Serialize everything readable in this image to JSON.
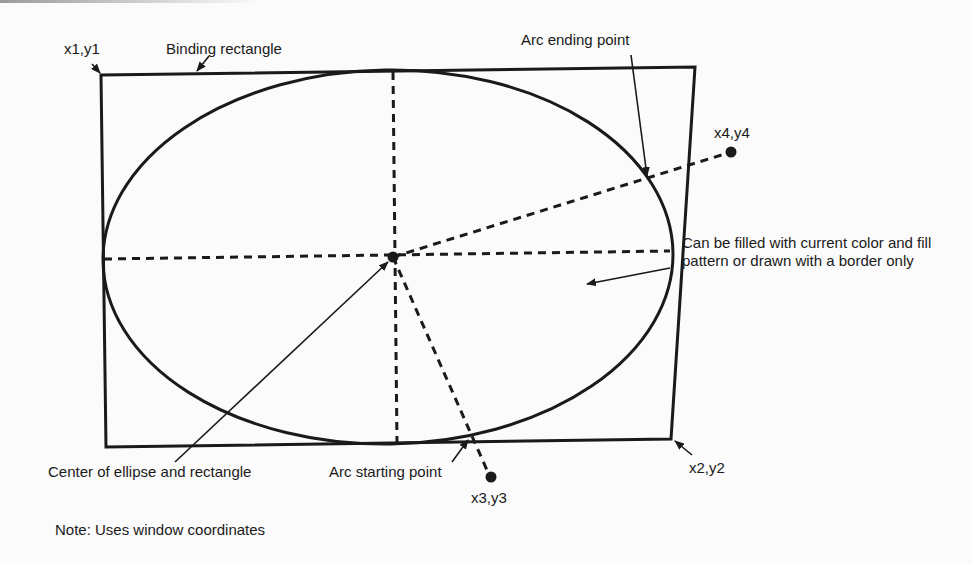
{
  "diagram": {
    "labels": {
      "top_left_corner": "x1,y1",
      "binding_rectangle": "Binding rectangle",
      "arc_ending_point": "Arc ending point",
      "end_point": "x4,y4",
      "fill_note": "Can be filled with current color and fill pattern or drawn with a border only",
      "center": "Center of ellipse and rectangle",
      "arc_starting_point": "Arc starting point",
      "start_point": "x3,y3",
      "bottom_right_corner": "x2,y2",
      "note": "Note: Uses window coordinates"
    },
    "colors": {
      "ink": "#1a1a1a",
      "background": "#fbfbfb"
    }
  }
}
